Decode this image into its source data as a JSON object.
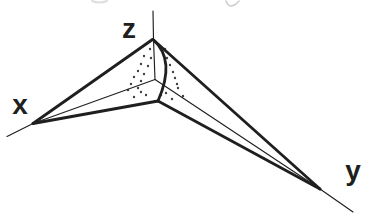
{
  "figure": {
    "kind": "3d-axes-tetrahedron-diagram",
    "background_color": "#ffffff",
    "ink_color": "#1f1f1f",
    "labels": [
      {
        "id": "x",
        "text": "x",
        "x": 20,
        "y": 114
      },
      {
        "id": "z",
        "text": "z",
        "x": 129,
        "y": 38
      },
      {
        "id": "y",
        "text": "y",
        "x": 353,
        "y": 180
      }
    ],
    "axes": [
      {
        "id": "z-axis-line",
        "d": "M 153,11 L 153.5,39.5 L 155,79.5"
      },
      {
        "id": "x-axis-line",
        "d": "M 7,136.5 L 33,123.5 L 155,79.5"
      },
      {
        "id": "y-axis-line",
        "d": "M 155,79.5 L 320,189 L 353,212"
      }
    ],
    "edges": [
      {
        "id": "edge-z-to-x",
        "d": "M 152.5,39.5 L 33,123.5"
      },
      {
        "id": "edge-z-to-y",
        "d": "M 153,39.5 L 320,189"
      },
      {
        "id": "edge-z-to-front",
        "d": "M 153.5,40 Q 176,60 158,101"
      },
      {
        "id": "edge-x-to-front",
        "d": "M 33,123.5 L 158,101"
      },
      {
        "id": "edge-front-to-y",
        "d": "M 158,101 L 320,189"
      }
    ],
    "stipple_dots": [
      [
        150,
        49
      ],
      [
        144,
        56
      ],
      [
        151,
        58
      ],
      [
        141,
        64
      ],
      [
        148,
        66
      ],
      [
        138,
        71
      ],
      [
        144,
        74
      ],
      [
        134,
        77
      ],
      [
        141,
        81
      ],
      [
        131,
        84
      ],
      [
        138,
        88
      ],
      [
        128,
        90
      ],
      [
        141,
        92
      ],
      [
        146,
        95
      ],
      [
        134,
        97
      ],
      [
        165,
        49
      ],
      [
        167,
        58
      ],
      [
        170,
        65
      ],
      [
        173,
        72
      ],
      [
        175,
        78
      ],
      [
        177,
        84
      ],
      [
        161,
        95
      ],
      [
        166,
        93
      ],
      [
        172,
        99
      ],
      [
        178,
        88
      ],
      [
        183,
        96
      ]
    ],
    "scan_artifacts": [
      {
        "id": "top-left-smudge",
        "d": "M 92,1 Q 99,4 107,1",
        "color": "#c2c2c2",
        "width": 2
      },
      {
        "id": "top-right-smudge",
        "d": "M 226,1 Q 229,9 236,4 L 239,1",
        "color": "#a8a8a8",
        "width": 1.6
      }
    ]
  }
}
